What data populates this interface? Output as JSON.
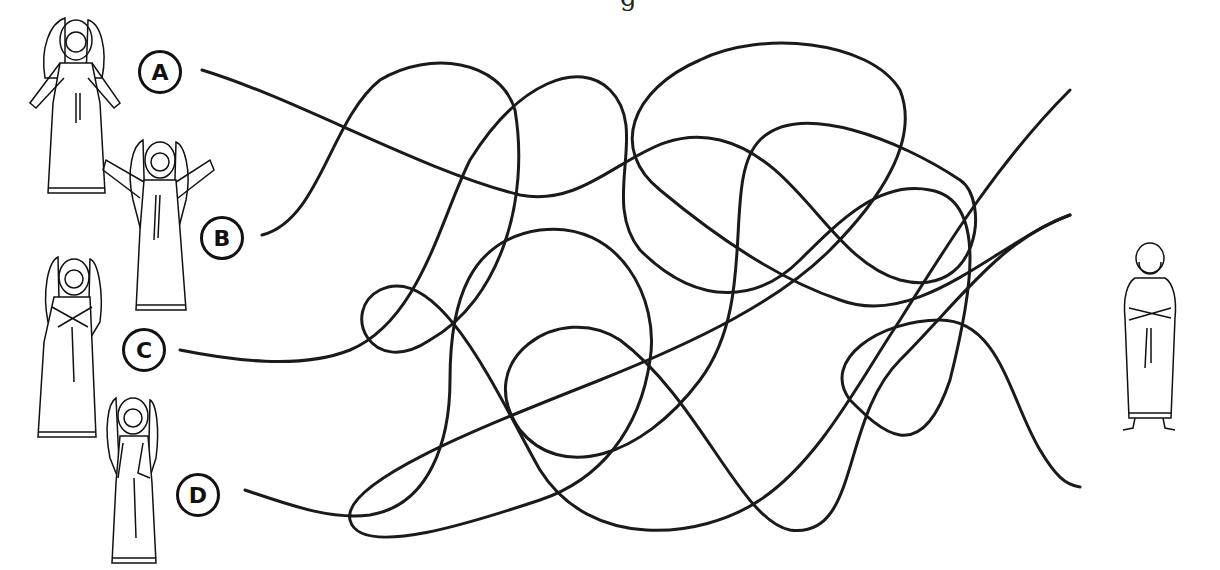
{
  "title_fragment": "g",
  "puzzle": {
    "type": "tangled-lines-matching",
    "start_labels": [
      "A",
      "B",
      "C",
      "D"
    ],
    "start_figures": [
      "angel-arms-open",
      "angel-arms-raised",
      "angel-hands-crossed",
      "angel-hand-on-chest"
    ],
    "end_figure": "bearded-man-arms-crossed",
    "line_color": "#1a1a1a",
    "line_count": 4
  }
}
